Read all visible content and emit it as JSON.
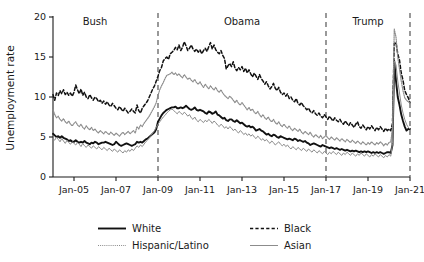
{
  "chart_data": {
    "type": "line",
    "title": "",
    "xlabel": "",
    "ylabel": "Unemployment rate",
    "ylim": [
      0,
      20
    ],
    "yticks": [
      0,
      5,
      10,
      15,
      20
    ],
    "ytick_labels": [
      "0",
      "5",
      "10",
      "15",
      "20"
    ],
    "grid": false,
    "legend_position": "bottom",
    "xlim": [
      "Jan-04",
      "Jan-21"
    ],
    "xticks": [
      "Jan-05",
      "Jan-07",
      "Jan-09",
      "Jan-11",
      "Jan-13",
      "Jan-15",
      "Jan-17",
      "Jan-19",
      "Jan-21"
    ],
    "annotations": [
      {
        "text": "Bush",
        "x": "Jan-06",
        "y": 19.0
      },
      {
        "text": "Obama",
        "x": "Jan-13",
        "y": 19.0
      },
      {
        "text": "Trump",
        "x": "Jan-19",
        "y": 19.0
      }
    ],
    "vertical_dividers": [
      "Jan-09",
      "Jan-17",
      "Jan-21"
    ],
    "x_start_year": 2004.0,
    "x_end_year": 2021.0,
    "series": [
      {
        "name": "White",
        "style": "solid-thick-black",
        "color": "#111111",
        "values": [
          5.4,
          5.2,
          5.0,
          5.1,
          4.9,
          5.1,
          4.9,
          4.8,
          4.7,
          4.5,
          4.6,
          4.4,
          4.4,
          4.6,
          4.4,
          4.3,
          4.4,
          4.3,
          4.5,
          4.3,
          4.2,
          4.1,
          4.3,
          4.2,
          4.4,
          4.3,
          4.1,
          4.2,
          4.3,
          4.3,
          4.4,
          4.3,
          4.2,
          4.1,
          4.0,
          4.1,
          4.4,
          4.2,
          4.0,
          3.9,
          4.0,
          4.1,
          4.2,
          4.1,
          4.0,
          3.9,
          4.0,
          4.1,
          4.4,
          4.3,
          4.4,
          4.3,
          4.5,
          4.7,
          4.8,
          5.0,
          5.2,
          5.4,
          5.6,
          6.0,
          6.9,
          7.3,
          7.7,
          8.0,
          8.2,
          8.4,
          8.5,
          8.6,
          8.7,
          8.7,
          8.8,
          8.6,
          8.6,
          8.7,
          8.6,
          8.7,
          8.9,
          8.7,
          8.5,
          8.4,
          8.5,
          8.7,
          8.4,
          8.3,
          8.4,
          8.3,
          8.2,
          8.0,
          7.9,
          8.2,
          8.1,
          7.9,
          8.0,
          8.2,
          7.8,
          7.7,
          7.5,
          7.3,
          7.4,
          7.1,
          7.0,
          7.2,
          7.2,
          7.0,
          6.9,
          7.1,
          6.9,
          6.7,
          6.8,
          6.6,
          6.4,
          6.3,
          6.4,
          6.2,
          6.3,
          6.1,
          5.8,
          5.9,
          6.0,
          5.8,
          5.7,
          5.5,
          5.3,
          5.4,
          5.2,
          5.1,
          5.3,
          5.2,
          5.0,
          4.9,
          5.1,
          5.0,
          4.9,
          4.8,
          4.7,
          4.8,
          4.7,
          4.6,
          4.8,
          4.7,
          4.5,
          4.6,
          4.5,
          4.4,
          4.5,
          4.3,
          4.2,
          4.0,
          4.1,
          4.2,
          4.1,
          4.0,
          3.9,
          3.8,
          4.0,
          3.9,
          3.8,
          3.7,
          3.6,
          3.7,
          3.6,
          3.5,
          3.6,
          3.5,
          3.4,
          3.5,
          3.4,
          3.3,
          3.4,
          3.3,
          3.2,
          3.3,
          3.2,
          3.3,
          3.2,
          3.1,
          3.2,
          3.1,
          3.2,
          3.1,
          3.2,
          3.1,
          3.0,
          3.1,
          3.0,
          3.1,
          3.0,
          3.1,
          3.0,
          2.9,
          3.0,
          3.1,
          3.1,
          3.0,
          4.0,
          14.5,
          12.0,
          10.0,
          9.0,
          7.8,
          7.0,
          6.3,
          5.8,
          6.0,
          6.0
        ]
      },
      {
        "name": "Black",
        "style": "dashed-black",
        "color": "#111111",
        "values": [
          10.3,
          9.6,
          10.5,
          10.2,
          10.8,
          10.4,
          10.9,
          10.3,
          10.6,
          10.2,
          10.5,
          10.1,
          10.6,
          11.5,
          10.9,
          10.4,
          11.0,
          10.2,
          10.6,
          10.0,
          9.8,
          10.3,
          9.9,
          9.6,
          10.0,
          9.8,
          9.4,
          9.6,
          9.2,
          9.5,
          9.1,
          9.4,
          9.0,
          8.8,
          9.2,
          8.9,
          8.6,
          8.4,
          8.8,
          8.5,
          8.2,
          8.6,
          8.3,
          8.0,
          8.2,
          8.5,
          8.2,
          8.0,
          9.0,
          8.3,
          8.0,
          8.6,
          8.9,
          9.2,
          9.5,
          10.0,
          10.5,
          11.0,
          11.4,
          12.0,
          12.6,
          13.3,
          13.7,
          14.5,
          14.8,
          15.0,
          14.7,
          15.4,
          15.6,
          15.8,
          16.2,
          15.9,
          16.5,
          15.8,
          16.2,
          16.9,
          16.4,
          15.8,
          16.1,
          16.5,
          16.0,
          15.7,
          16.0,
          15.6,
          15.9,
          15.4,
          15.8,
          16.1,
          15.7,
          16.3,
          16.8,
          16.0,
          16.5,
          15.9,
          15.6,
          15.4,
          15.8,
          15.2,
          14.8,
          13.5,
          13.9,
          14.2,
          13.8,
          14.4,
          13.6,
          13.3,
          13.7,
          13.4,
          13.8,
          13.2,
          13.6,
          13.0,
          13.4,
          12.9,
          12.5,
          13.0,
          12.6,
          12.2,
          12.8,
          12.3,
          12.0,
          11.6,
          11.9,
          11.4,
          11.0,
          11.3,
          11.7,
          11.1,
          10.8,
          11.2,
          10.6,
          10.3,
          10.5,
          10.1,
          10.4,
          9.8,
          10.0,
          9.6,
          9.4,
          9.8,
          9.2,
          9.0,
          9.3,
          8.9,
          8.7,
          8.4,
          8.6,
          8.2,
          8.0,
          8.3,
          7.9,
          7.7,
          8.0,
          7.6,
          7.4,
          7.8,
          7.5,
          7.2,
          7.6,
          7.3,
          7.0,
          7.4,
          7.1,
          6.9,
          7.2,
          6.8,
          6.6,
          7.0,
          6.7,
          6.4,
          6.8,
          6.5,
          6.2,
          6.6,
          6.9,
          6.3,
          6.1,
          6.5,
          6.2,
          5.9,
          6.3,
          6.0,
          6.4,
          6.1,
          5.8,
          6.2,
          5.9,
          6.3,
          6.0,
          5.7,
          6.1,
          5.8,
          6.0,
          5.8,
          6.7,
          16.7,
          16.8,
          15.4,
          14.6,
          13.0,
          12.1,
          10.8,
          10.3,
          9.9,
          9.3
        ]
      },
      {
        "name": "Hispanic/Latino",
        "style": "dotted-gray",
        "color": "#8c8c8c",
        "values": [
          8.4,
          7.8,
          7.4,
          7.6,
          7.2,
          7.0,
          7.3,
          6.9,
          6.7,
          7.0,
          6.6,
          6.4,
          6.7,
          6.9,
          6.5,
          6.3,
          6.6,
          6.2,
          6.0,
          6.4,
          6.1,
          5.9,
          6.2,
          5.8,
          6.0,
          5.7,
          5.5,
          5.8,
          5.6,
          5.4,
          5.7,
          5.5,
          5.3,
          5.6,
          5.4,
          5.2,
          5.5,
          5.3,
          5.1,
          5.4,
          5.6,
          5.3,
          5.5,
          5.7,
          5.4,
          5.6,
          5.8,
          5.5,
          6.3,
          6.0,
          6.5,
          6.3,
          6.7,
          7.0,
          7.3,
          7.6,
          8.0,
          8.4,
          8.8,
          9.3,
          10.2,
          10.9,
          11.4,
          11.8,
          12.3,
          12.7,
          12.8,
          12.9,
          13.1,
          12.8,
          13.0,
          12.7,
          12.9,
          12.6,
          12.4,
          12.8,
          12.5,
          12.2,
          12.4,
          12.1,
          11.9,
          12.2,
          11.8,
          11.6,
          11.9,
          11.5,
          11.2,
          11.6,
          11.3,
          11.0,
          11.4,
          11.1,
          10.9,
          11.2,
          10.8,
          10.6,
          10.9,
          10.5,
          10.2,
          10.0,
          9.8,
          10.1,
          9.9,
          9.6,
          9.3,
          9.6,
          9.2,
          9.0,
          9.3,
          9.0,
          8.7,
          8.4,
          8.7,
          8.3,
          8.5,
          8.1,
          7.9,
          8.2,
          7.8,
          7.5,
          7.8,
          7.4,
          7.2,
          7.5,
          7.1,
          6.9,
          7.2,
          6.8,
          6.6,
          6.9,
          6.5,
          6.3,
          6.6,
          6.3,
          6.1,
          6.4,
          6.0,
          5.8,
          6.1,
          5.9,
          5.7,
          6.0,
          5.6,
          5.4,
          5.7,
          5.5,
          5.3,
          5.6,
          5.2,
          5.0,
          5.3,
          5.1,
          4.9,
          5.2,
          4.8,
          5.0,
          5.2,
          4.9,
          4.7,
          5.0,
          4.8,
          4.6,
          4.9,
          4.7,
          4.5,
          4.8,
          4.6,
          4.4,
          4.7,
          4.5,
          4.3,
          4.6,
          4.4,
          4.2,
          4.5,
          4.3,
          4.1,
          4.4,
          4.2,
          4.0,
          4.3,
          4.1,
          4.4,
          4.2,
          4.0,
          4.3,
          4.1,
          4.4,
          4.2,
          3.9,
          4.2,
          4.0,
          4.3,
          4.4,
          6.0,
          18.5,
          17.5,
          15.0,
          13.5,
          12.0,
          10.8,
          9.9,
          9.6,
          9.4,
          9.3
        ]
      },
      {
        "name": "Asian",
        "style": "solid-thin-gray",
        "color": "#8c8c8c",
        "values": [
          4.8,
          4.6,
          5.0,
          4.7,
          4.4,
          4.8,
          4.5,
          4.2,
          4.6,
          4.3,
          4.1,
          4.4,
          4.2,
          4.0,
          4.3,
          4.1,
          3.8,
          4.2,
          3.9,
          3.7,
          4.0,
          3.8,
          3.6,
          3.9,
          3.7,
          3.5,
          3.8,
          3.6,
          3.4,
          3.7,
          3.5,
          3.3,
          3.6,
          3.4,
          3.2,
          3.5,
          3.3,
          3.1,
          3.4,
          3.2,
          3.0,
          3.3,
          3.1,
          3.4,
          3.2,
          3.5,
          3.3,
          3.6,
          3.9,
          3.7,
          4.0,
          3.8,
          4.1,
          4.4,
          4.6,
          4.9,
          5.2,
          5.5,
          5.8,
          6.2,
          6.6,
          6.9,
          7.2,
          7.5,
          7.7,
          8.0,
          8.2,
          8.4,
          8.5,
          8.3,
          8.1,
          7.9,
          8.2,
          8.0,
          7.8,
          8.1,
          7.9,
          7.6,
          7.8,
          7.4,
          7.2,
          7.5,
          7.1,
          6.9,
          7.2,
          7.0,
          6.8,
          7.1,
          6.9,
          7.2,
          7.0,
          6.7,
          7.0,
          6.8,
          6.5,
          6.3,
          6.6,
          6.4,
          6.1,
          6.3,
          6.0,
          6.3,
          6.1,
          5.8,
          6.0,
          5.7,
          5.5,
          5.8,
          5.6,
          5.3,
          5.5,
          5.2,
          5.4,
          5.1,
          5.3,
          5.0,
          4.8,
          5.1,
          4.9,
          4.6,
          4.8,
          4.5,
          4.7,
          4.4,
          4.2,
          4.5,
          4.3,
          4.0,
          4.2,
          4.4,
          4.1,
          3.9,
          4.1,
          3.8,
          4.0,
          3.7,
          3.5,
          3.8,
          3.6,
          3.4,
          3.7,
          3.5,
          3.3,
          3.6,
          3.4,
          3.2,
          3.5,
          3.3,
          3.1,
          3.4,
          3.2,
          3.0,
          3.3,
          3.1,
          2.9,
          3.2,
          3.0,
          2.8,
          3.1,
          2.9,
          3.2,
          3.0,
          2.8,
          3.1,
          2.9,
          2.7,
          3.0,
          2.8,
          3.1,
          2.9,
          2.7,
          3.0,
          2.8,
          2.6,
          2.9,
          2.7,
          3.0,
          2.8,
          2.6,
          2.9,
          2.7,
          2.5,
          2.8,
          2.6,
          2.9,
          2.7,
          2.5,
          2.8,
          2.6,
          2.4,
          2.7,
          2.5,
          2.8,
          2.6,
          4.2,
          14.5,
          14.0,
          12.0,
          10.5,
          9.0,
          8.0,
          7.2,
          6.6,
          6.2,
          6.0
        ]
      }
    ]
  },
  "legend": {
    "entries": [
      {
        "label": "White",
        "key": "white"
      },
      {
        "label": "Black",
        "key": "black"
      },
      {
        "label": "Hispanic/Latino",
        "key": "hispanic"
      },
      {
        "label": "Asian",
        "key": "asian"
      }
    ]
  },
  "colors": {
    "black_line": "#111111",
    "gray_line": "#8c8c8c",
    "divider": "#555555",
    "axis": "#1a1a1a",
    "background": "#ffffff"
  }
}
